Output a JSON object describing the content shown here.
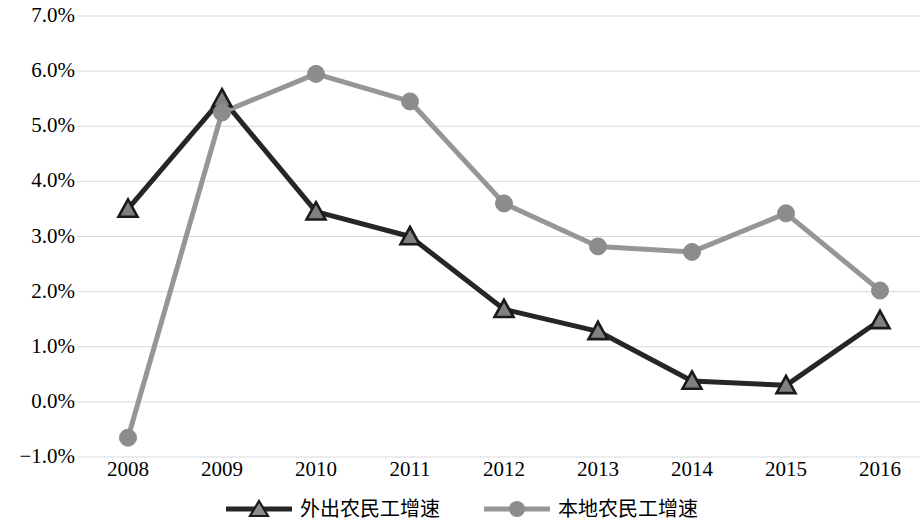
{
  "chart_data": {
    "type": "line",
    "title": "",
    "subtitle": "",
    "xlabel": "",
    "ylabel": "",
    "categories": [
      "2008",
      "2009",
      "2010",
      "2011",
      "2012",
      "2013",
      "2014",
      "2015",
      "2016"
    ],
    "x_tick_labels": [
      "2008",
      "2009",
      "2010",
      "2011",
      "2012",
      "2013",
      "2014",
      "2015",
      "2016"
    ],
    "y_tick_labels": [
      "7.0%",
      "6.0%",
      "5.0%",
      "4.0%",
      "3.0%",
      "2.0%",
      "1.0%",
      "0.0%",
      "−1.0%"
    ],
    "y_tick_values": [
      7.0,
      6.0,
      5.0,
      4.0,
      3.0,
      2.0,
      1.0,
      0.0,
      -1.0
    ],
    "ylim": [
      -1.0,
      7.0
    ],
    "y_unit": "%",
    "grid": true,
    "grid_axis": "y",
    "legend_position": "bottom",
    "series": [
      {
        "name": "外出农民工增速",
        "marker": "triangle",
        "color": "#262626",
        "marker_fill": "#808080",
        "marker_edge": "#1a1a1a",
        "values": [
          3.5,
          5.5,
          3.45,
          3.0,
          1.68,
          1.28,
          0.38,
          0.3,
          1.48
        ]
      },
      {
        "name": "本地农民工增速",
        "marker": "circle",
        "color": "#969696",
        "marker_fill": "#8c8c8c",
        "marker_edge": "#8c8c8c",
        "values": [
          -0.65,
          5.25,
          5.95,
          5.45,
          3.6,
          2.82,
          2.72,
          3.42,
          2.02
        ]
      }
    ]
  },
  "legend": {
    "entries": [
      {
        "label": "外出农民工增速",
        "marker": "triangle-marker",
        "color": "#262626"
      },
      {
        "label": "本地农民工增速",
        "marker": "circle-marker",
        "color": "#969696"
      }
    ]
  },
  "colors": {
    "series_dark": "#262626",
    "series_gray": "#969696",
    "gridline": "#d9d9d9",
    "text": "#000000",
    "background": "#ffffff"
  }
}
